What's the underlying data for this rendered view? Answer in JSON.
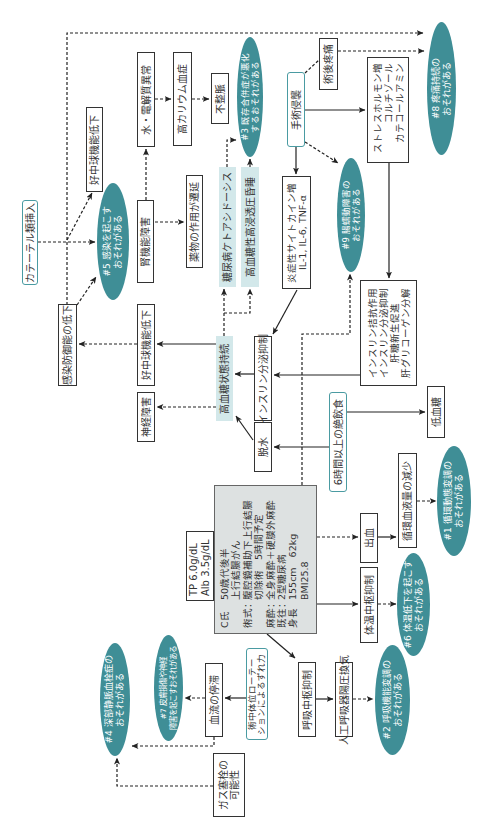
{
  "patient": {
    "rows": [
      {
        "label": "C氏",
        "lines": [
          "50歳代後半",
          "上行結腸がん"
        ]
      },
      {
        "label": "術式：",
        "lines": [
          "腹腔鏡補助下上行結腸",
          "切除術　5時間予定"
        ]
      },
      {
        "label": "麻酔：",
        "lines": [
          "全身麻酔＋硬膜外麻酔"
        ]
      },
      {
        "label": "既往：",
        "lines": [
          "2型糖尿病"
        ]
      },
      {
        "label": "身長",
        "lines": [
          "155cm　62kg",
          "BMI25.8"
        ]
      }
    ]
  },
  "labs": {
    "lines": [
      "TP 6.0g/dL",
      "Alb 3.5g/dL"
    ]
  },
  "nodes": {
    "catheter": "カテーテル類挿入",
    "infection_defense_down": "感染防御能の低下",
    "neutrophil_down_upper": "好中球機能低下",
    "neutrophil_down_lower": "好中球機能低下",
    "water_electrolyte": "水・電解質異常",
    "hyperkalemia": "高カリウム血症",
    "arrhythmia": "不整脈",
    "renal_dysfunction": "腎機能障害",
    "drug_prolonged": "薬物の作用が遷延",
    "neuropathy": "神経障害",
    "dka": "糖尿病ケトアシドーシス",
    "hhs": "高血糖性高浸透圧昏睡",
    "hyperglycemia": "高血糖状態持続",
    "insulin_suppression": "インスリン分泌抑制",
    "cytokine": [
      "炎症性サイトカイン増",
      "IL-1, IL-6, TNF-α"
    ],
    "surgical_invasion": "手術侵襲",
    "postop_pain": "術後疼痛",
    "stress_hormone": [
      "ストレスホルモン増",
      "コルチゾール",
      "カテコールアミン"
    ],
    "insulin_antagonism": [
      "インスリン拮抗作用",
      "インスリン分泌抑制",
      "肝糖新生促進",
      "肝グリコーゲン分解"
    ],
    "fasting": "6時間以上の絶飲食",
    "hypoglycemia": "低血糖",
    "dehydration": "脱水",
    "bleeding": "出血",
    "blood_volume_down": "循環血液量の減少",
    "thermo_center": "体温中枢抑制",
    "resp_center": "呼吸中枢抑制",
    "ventilation": "人工呼吸器陽圧換気",
    "position_rotation": [
      "術中体位ローテー",
      "ションによるずれ力"
    ],
    "blood_stasis": "血流の停滞",
    "gas_embolism": [
      "ガス塞栓の",
      "可能性"
    ]
  },
  "problems": {
    "p1": [
      "#1 循環動態変調の",
      "おそれがある"
    ],
    "p2": [
      "#2 呼吸機能変調の",
      "おそれがある"
    ],
    "p3": [
      "#3 既存合併症が悪化",
      "するおそれがある"
    ],
    "p4": [
      "#4 深部静脈血栓症の",
      "おそれがある"
    ],
    "p5": [
      "#5 感染を起こす",
      "おそれがある"
    ],
    "p6": [
      "#6 体温低下を起こす",
      "おそれがある"
    ],
    "p7": [
      "#7 皮膚損傷や神経",
      "障害を起こすおそれがある"
    ],
    "p8": [
      "#8 疼痛持続の",
      "おそれがある"
    ],
    "p9": [
      "#9 腸蠕動障害の",
      "おそれがある"
    ]
  },
  "colors": {
    "problem_fill": "#3f8e96",
    "trigger_border": "#4a9ba2",
    "highlight_fill": "#d3e8ea",
    "patient_fill": "#dde1e1",
    "line": "#222222"
  }
}
